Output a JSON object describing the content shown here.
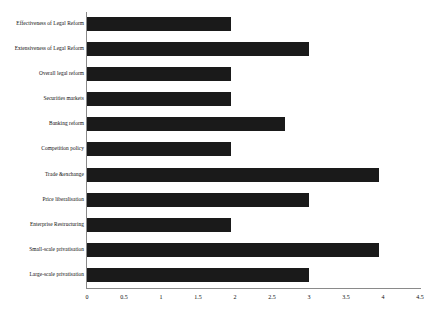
{
  "chart_data": {
    "type": "bar",
    "orientation": "horizontal",
    "title": "",
    "subtitle": "",
    "xlabel": "",
    "ylabel": "",
    "xlim": [
      0,
      4.5
    ],
    "grid": false,
    "legend": null,
    "legend_position": "none",
    "bar_color": "#1a1a1a",
    "axis_color": "#8a8a8a",
    "background": "#ffffff",
    "xticks": [
      "0",
      "0.5",
      "1",
      "1.5",
      "2",
      "2.5",
      "3",
      "3.5",
      "4",
      "4.5"
    ],
    "xtick_values": [
      0,
      0.5,
      1,
      1.5,
      2,
      2.5,
      3,
      3.5,
      4,
      4.5
    ],
    "categories": [
      "Effectiveness of Legal Reform",
      "Extensiveness of Legal Reform",
      "Overall legal reform",
      "Securities markets",
      "Banking reform",
      "Competition policy",
      "Trade &exchange",
      "Price liberalisation",
      "Enterprise Restructuring",
      "Small-scale privatisation",
      "Large-scale privatisation"
    ],
    "values": [
      1.95,
      3.0,
      1.95,
      1.95,
      2.67,
      1.95,
      3.95,
      3.0,
      1.95,
      3.95,
      3.0
    ]
  }
}
